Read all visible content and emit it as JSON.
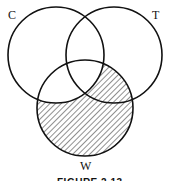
{
  "diagram": {
    "type": "venn",
    "sets": [
      {
        "id": "C",
        "label": "C",
        "cx": 56,
        "cy": 55,
        "r": 48
      },
      {
        "id": "T",
        "label": "T",
        "cx": 114,
        "cy": 55,
        "r": 48
      },
      {
        "id": "W",
        "label": "W",
        "cx": 85,
        "cy": 108,
        "r": 48
      }
    ],
    "shaded_region": "W minus C",
    "caption": "FIGURE 2.13",
    "colors": {
      "stroke": "#111111",
      "hatch": "#333333",
      "background": "#ffffff"
    }
  }
}
